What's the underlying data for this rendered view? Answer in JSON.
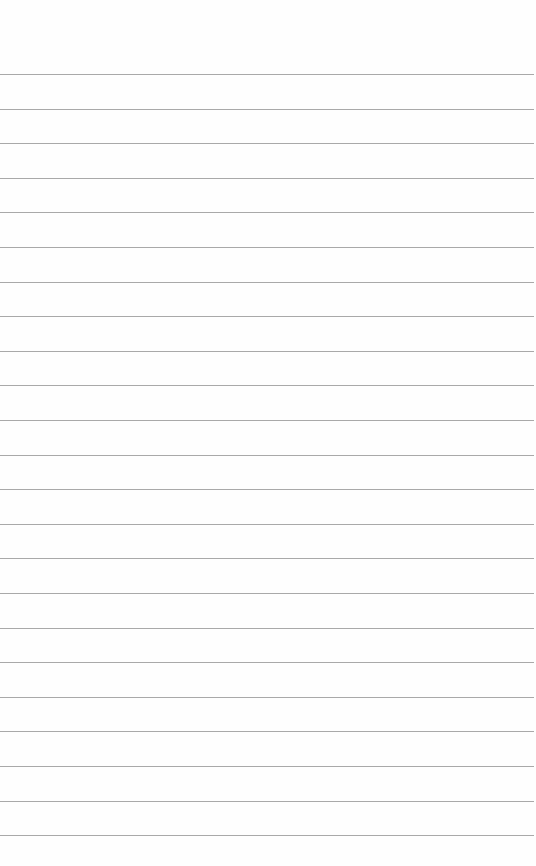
{
  "page": {
    "type": "lined-paper",
    "background_color": "#fefefe",
    "rule_color": "#9a9a9a",
    "rule_count": 23,
    "first_rule_y": 74,
    "rule_spacing": 34.6,
    "text": ""
  }
}
